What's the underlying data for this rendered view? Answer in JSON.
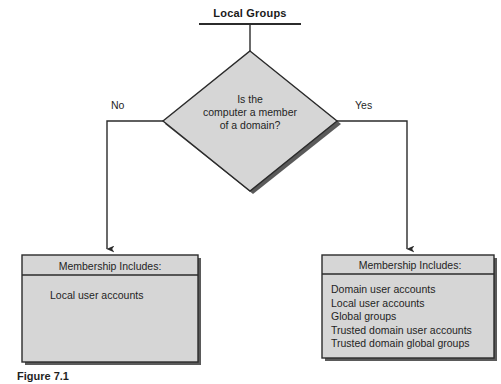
{
  "title": {
    "text": "Local Groups"
  },
  "decision": {
    "line1": "Is the",
    "line2": "computer a member",
    "line3": "of a domain?"
  },
  "branches": {
    "no_label": "No",
    "yes_label": "Yes"
  },
  "left_box": {
    "header": "Membership Includes:",
    "items": [
      "Local user accounts"
    ]
  },
  "right_box": {
    "header": "Membership Includes:",
    "items": [
      "Domain user accounts",
      "Local user accounts",
      "Global groups",
      "Trusted domain user accounts",
      "Trusted domain global groups"
    ]
  },
  "caption": {
    "text": "Figure 7.1"
  },
  "colors": {
    "shape_fill": "#d6d6d6",
    "shape_outline": "#2b2b2b",
    "shadow": "#5a5a5a",
    "line": "#2b2b2b",
    "text": "#1f1f1f",
    "background": "#ffffff"
  }
}
